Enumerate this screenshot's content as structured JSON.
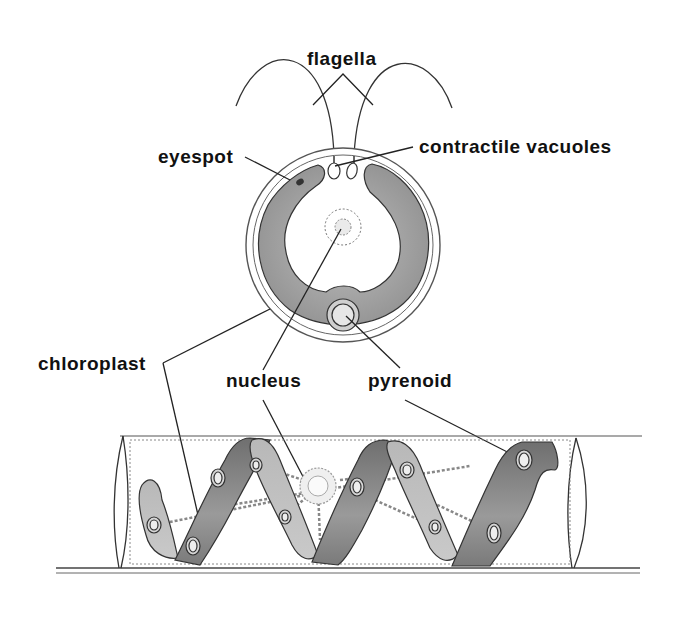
{
  "diagram": {
    "type": "biology-illustration",
    "subject_top": "single cell with two flagella (top view)",
    "subject_bottom": "filamentous cell with spiral chloroplast"
  },
  "labels": {
    "flagella": "flagella",
    "eyespot": "eyespot",
    "contractile_vacuoles": "contractile vacuoles",
    "chloroplast": "chloroplast",
    "nucleus": "nucleus",
    "pyrenoid": "pyrenoid"
  },
  "colors": {
    "background": "#ffffff",
    "ink": "#1a1a1a",
    "chloroplast_fill": "#9a9a9a",
    "chloroplast_light": "#c4c4c4",
    "chloroplast_dark": "#6e6e6e",
    "cell_wall": "#555555"
  }
}
